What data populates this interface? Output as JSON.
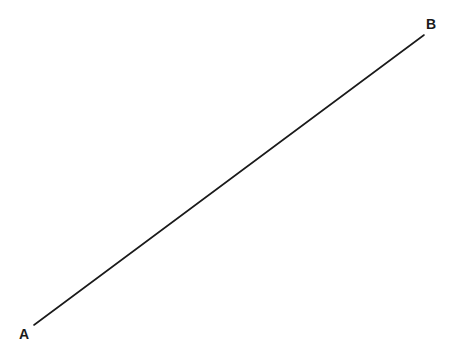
{
  "figure": {
    "background_color": "#ffffff",
    "width": 464,
    "height": 358
  },
  "chart_data": {
    "type": "line",
    "title": "",
    "subtitle": "",
    "xlabel": "",
    "ylabel": "",
    "grid": false,
    "legend": null,
    "axes_visible": false,
    "xlim": [
      0,
      464
    ],
    "ylim": [
      0,
      358
    ],
    "series": [
      {
        "name": "segment-AB",
        "color": "#1a1a1a",
        "stroke_width": 1.6,
        "x": [
          34,
          424
        ],
        "y": [
          325,
          35
        ],
        "points": [
          {
            "label": "A",
            "x": 34,
            "y": 325
          },
          {
            "label": "B",
            "x": 424,
            "y": 35
          }
        ]
      }
    ],
    "annotations": [
      {
        "text": "A",
        "x": 19,
        "y": 327,
        "anchor": "endpoint-lower-left"
      },
      {
        "text": "B",
        "x": 426,
        "y": 17,
        "anchor": "endpoint-upper-right"
      }
    ]
  },
  "labels": {
    "a": "A",
    "b": "B"
  },
  "colors": {
    "line": "#1a1a1a",
    "background": "#ffffff",
    "text": "#1a1a1a"
  }
}
